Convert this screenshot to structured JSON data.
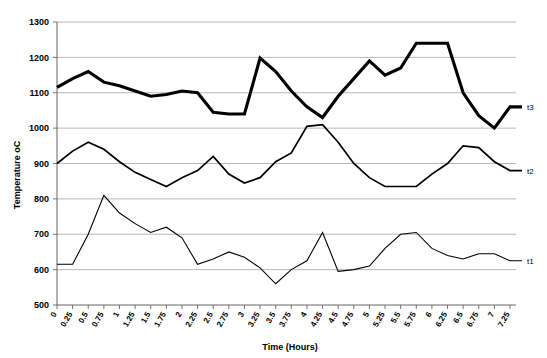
{
  "chart_data": {
    "type": "line",
    "title": "",
    "xlabel": "Time (Hours)",
    "ylabel": "Temperature oC",
    "ylim": [
      500,
      1300
    ],
    "ytick_step": 100,
    "yticks": [
      500,
      600,
      700,
      800,
      900,
      1000,
      1100,
      1200,
      1300
    ],
    "grid": true,
    "legend_position": "right-inline-end-of-line",
    "x": [
      0,
      0.25,
      0.5,
      0.75,
      1,
      1.25,
      1.5,
      1.75,
      2,
      2.25,
      2.5,
      2.75,
      3,
      3.25,
      3.5,
      3.75,
      4,
      4.25,
      4.5,
      4.75,
      5,
      5.25,
      5.5,
      5.75,
      6,
      6.25,
      6.5,
      6.75,
      7,
      7.25
    ],
    "xtick_labels": [
      "0",
      "0.25",
      "0.5",
      "0.75",
      "1",
      "1.25",
      "1.5",
      "1.75",
      "2",
      "2.25",
      "2.5",
      "2.75",
      "3",
      "3.25",
      "3.5",
      "3.75",
      "4",
      "4.25",
      "4.5",
      "4.75",
      "5",
      "5.25",
      "5.5",
      "5.75",
      "6",
      "6.25",
      "6.5",
      "6.75",
      "7",
      "7.25"
    ],
    "series": [
      {
        "name": "t3",
        "label": "t3",
        "line_weight": "thick",
        "color": "#000000",
        "values": [
          1115,
          1140,
          1160,
          1130,
          1120,
          1105,
          1090,
          1095,
          1105,
          1100,
          1045,
          1040,
          1040,
          1198,
          1160,
          1105,
          1060,
          1030,
          1090,
          1140,
          1190,
          1150,
          1170,
          1240,
          1240,
          1240,
          1100,
          1035,
          1000,
          1060
        ]
      },
      {
        "name": "t2",
        "label": "t2",
        "line_weight": "mid",
        "color": "#000000",
        "values": [
          900,
          935,
          960,
          940,
          905,
          875,
          855,
          835,
          860,
          880,
          920,
          870,
          845,
          860,
          905,
          930,
          1005,
          1010,
          960,
          900,
          860,
          835,
          835,
          835,
          870,
          900,
          950,
          945,
          905,
          880
        ]
      },
      {
        "name": "t1",
        "label": "t1",
        "line_weight": "thin",
        "color": "#000000",
        "values": [
          615,
          615,
          700,
          810,
          760,
          730,
          705,
          720,
          690,
          615,
          630,
          650,
          635,
          605,
          560,
          600,
          625,
          705,
          595,
          600,
          610,
          660,
          700,
          705,
          660,
          640,
          630,
          645,
          645,
          625
        ]
      }
    ]
  },
  "axes": {
    "y_title": "Temperature oC",
    "x_title": "Time (Hours)"
  }
}
